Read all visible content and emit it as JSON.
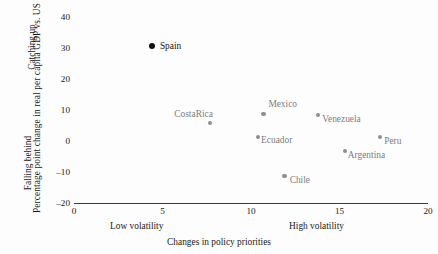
{
  "chart_data": {
    "type": "scatter",
    "title": "",
    "xlabel": "Changes in policy priorities",
    "ylabel": "Percentage point change in real per capita GDP vs. US",
    "xlim": [
      0,
      20
    ],
    "ylim": [
      -20,
      40
    ],
    "xticks": [
      0,
      5,
      10,
      15,
      20
    ],
    "yticks": [
      40,
      30,
      20,
      10,
      0,
      -10,
      -20
    ],
    "xtick_labels": [
      "0",
      "5",
      "10",
      "15",
      "20"
    ],
    "ytick_labels": [
      "40",
      "30",
      "20",
      "10",
      "0",
      "–10",
      "–20"
    ],
    "grid": false,
    "legend": "none",
    "x_axis_annotations": {
      "low": "Low volatility",
      "high": "High volatility"
    },
    "y_axis_annotations": {
      "top": "Catching up",
      "bottom": "Falling behind"
    },
    "points": [
      {
        "label": "Spain",
        "x": 4.4,
        "y": 30.6,
        "highlight": true,
        "label_dx": 8,
        "label_dy": -5
      },
      {
        "label": "CostaRica",
        "x": 7.7,
        "y": 5.8,
        "highlight": false,
        "label_dx": -36,
        "label_dy": -14
      },
      {
        "label": "Mexico",
        "x": 10.7,
        "y": 8.7,
        "highlight": false,
        "label_dx": 5,
        "label_dy": -15
      },
      {
        "label": "Ecuador",
        "x": 10.4,
        "y": 1.3,
        "highlight": false,
        "label_dx": 3,
        "label_dy": -2
      },
      {
        "label": "Venezuela",
        "x": 13.8,
        "y": 8.4,
        "highlight": false,
        "label_dx": 4,
        "label_dy": -1
      },
      {
        "label": "Peru",
        "x": 17.3,
        "y": 1.3,
        "highlight": false,
        "label_dx": 4,
        "label_dy": -1
      },
      {
        "label": "Argentina",
        "x": 15.3,
        "y": -3.2,
        "highlight": false,
        "label_dx": 3,
        "label_dy": -1
      },
      {
        "label": "Chile",
        "x": 11.9,
        "y": -11.3,
        "highlight": false,
        "label_dx": 5,
        "label_dy": -1
      }
    ]
  }
}
